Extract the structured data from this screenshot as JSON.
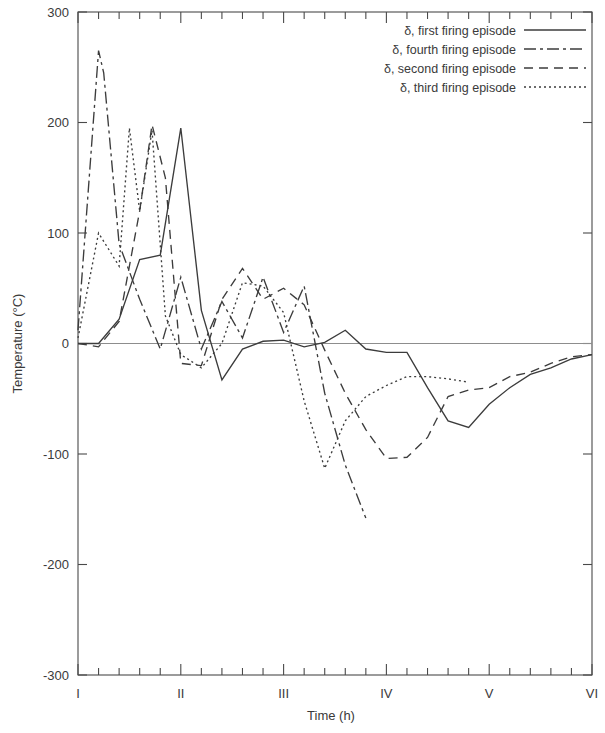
{
  "chart_data": {
    "type": "line",
    "title": "",
    "xlabel": "Time (h)",
    "ylabel": "Temperature (°C)",
    "xlim": [
      0,
      5
    ],
    "ylim": [
      -300,
      300
    ],
    "yticks": [
      300,
      200,
      100,
      0,
      -100,
      -200,
      -300
    ],
    "ytick_labels": [
      "300",
      "200",
      "100",
      "0",
      "-100",
      "-200",
      "-300"
    ],
    "xticks": [
      0,
      1,
      2,
      3,
      4,
      5
    ],
    "xtick_labels": [
      "I",
      "II",
      "III",
      "IV",
      "V",
      "VI"
    ],
    "x_minor_ticks_per_interval": 5,
    "grid": false,
    "zero_line": true,
    "legend_position": "top-right",
    "line_color": "#3c3c3c",
    "series": [
      {
        "name": "δ, first firing episode",
        "dash": "solid",
        "dasharray": "none",
        "x": [
          0.0,
          0.2,
          0.4,
          0.6,
          0.8,
          1.0,
          1.2,
          1.4,
          1.6,
          1.8,
          2.0,
          2.2,
          2.4,
          2.6,
          2.8,
          3.0,
          3.2,
          3.4,
          3.6,
          3.8,
          4.0,
          4.2,
          4.4,
          4.6,
          4.8,
          5.0
        ],
        "y": [
          0,
          0,
          22,
          76,
          80,
          195,
          30,
          -33,
          -5,
          2,
          3,
          -3,
          1,
          12,
          -5,
          -8,
          -8,
          -40,
          -70,
          -76,
          -55,
          -40,
          -28,
          -22,
          -14,
          -10
        ]
      },
      {
        "name": "δ, fourth firing episode",
        "dash": "dashdot",
        "dasharray": "12,4,3,4",
        "x": [
          0.0,
          0.2,
          0.25,
          0.4,
          0.6,
          0.8,
          1.0,
          1.2,
          1.4,
          1.6,
          1.8,
          2.0,
          2.2,
          2.4,
          2.6,
          2.8
        ],
        "y": [
          12,
          265,
          245,
          90,
          40,
          -5,
          60,
          -5,
          38,
          5,
          60,
          10,
          52,
          -45,
          -110,
          -158
        ]
      },
      {
        "name": "δ, second firing episode",
        "dash": "dashed",
        "dasharray": "9,6",
        "x": [
          0.0,
          0.2,
          0.4,
          0.6,
          0.72,
          0.85,
          1.0,
          1.2,
          1.4,
          1.6,
          1.8,
          2.0,
          2.2,
          2.4,
          2.6,
          2.8,
          3.0,
          3.2,
          3.4,
          3.6,
          3.8,
          4.0,
          4.2,
          4.4,
          4.6,
          4.8,
          5.0
        ],
        "y": [
          0,
          -3,
          20,
          120,
          198,
          150,
          -18,
          -20,
          40,
          68,
          40,
          50,
          35,
          -6,
          -45,
          -78,
          -104,
          -103,
          -85,
          -48,
          -42,
          -40,
          -30,
          -26,
          -18,
          -12,
          -10
        ]
      },
      {
        "name": "δ, third firing episode",
        "dash": "dotted",
        "dasharray": "2,3",
        "x": [
          0.0,
          0.2,
          0.4,
          0.5,
          0.6,
          0.72,
          0.85,
          1.0,
          1.2,
          1.4,
          1.6,
          1.8,
          2.0,
          2.2,
          2.4,
          2.6,
          2.8,
          3.0,
          3.2,
          3.4,
          3.6,
          3.8
        ],
        "y": [
          5,
          100,
          70,
          195,
          120,
          193,
          25,
          -10,
          -22,
          0,
          55,
          52,
          28,
          -52,
          -113,
          -70,
          -48,
          -38,
          -30,
          -30,
          -32,
          -35
        ]
      }
    ]
  },
  "axes": {
    "y_title": "Temperature (°C)",
    "x_title": "Time (h)"
  },
  "legend": {
    "entries": [
      {
        "label": "δ, first firing episode",
        "style": "solid"
      },
      {
        "label": "δ, fourth firing episode",
        "style": "dashdot"
      },
      {
        "label": "δ, second firing episode",
        "style": "dashed"
      },
      {
        "label": "δ, third firing episode",
        "style": "dotted"
      }
    ]
  }
}
